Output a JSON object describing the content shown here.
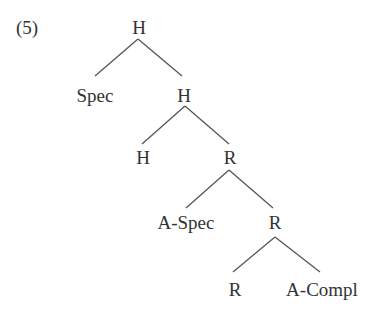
{
  "example_number": "(5)",
  "tree": {
    "nodes": [
      {
        "id": "n_root",
        "label": "H",
        "x": 139,
        "y": 27
      },
      {
        "id": "n_spec",
        "label": "Spec",
        "x": 95,
        "y": 95
      },
      {
        "id": "n_h2",
        "label": "H",
        "x": 184,
        "y": 95
      },
      {
        "id": "n_h3",
        "label": "H",
        "x": 143,
        "y": 157
      },
      {
        "id": "n_r1",
        "label": "R",
        "x": 230,
        "y": 157
      },
      {
        "id": "n_aspec",
        "label": "A-Spec",
        "x": 186,
        "y": 222
      },
      {
        "id": "n_r2",
        "label": "R",
        "x": 275,
        "y": 222
      },
      {
        "id": "n_r3",
        "label": "R",
        "x": 235,
        "y": 289
      },
      {
        "id": "n_acompl",
        "label": "A-Compl",
        "x": 322,
        "y": 289
      }
    ],
    "edges": [
      {
        "x1": 138,
        "y1": 39,
        "x2": 95,
        "y2": 76
      },
      {
        "x1": 138,
        "y1": 39,
        "x2": 182,
        "y2": 76
      },
      {
        "x1": 185,
        "y1": 106,
        "x2": 142,
        "y2": 144
      },
      {
        "x1": 185,
        "y1": 106,
        "x2": 229,
        "y2": 144
      },
      {
        "x1": 229,
        "y1": 170,
        "x2": 186,
        "y2": 208
      },
      {
        "x1": 229,
        "y1": 170,
        "x2": 273,
        "y2": 208
      },
      {
        "x1": 275,
        "y1": 237,
        "x2": 233,
        "y2": 272
      },
      {
        "x1": 275,
        "y1": 237,
        "x2": 320,
        "y2": 272
      }
    ]
  }
}
